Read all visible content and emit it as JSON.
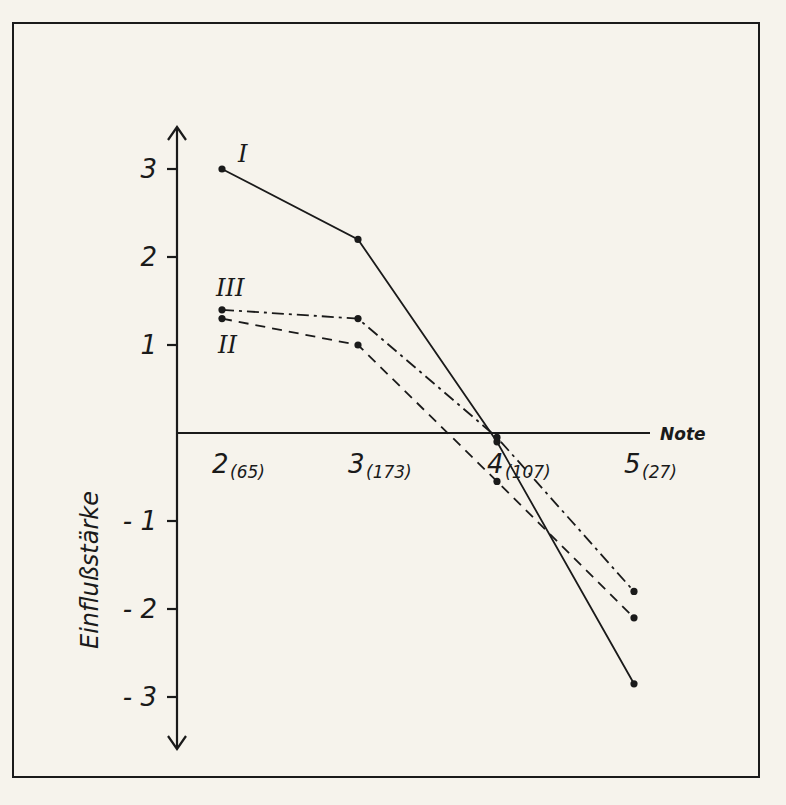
{
  "chart_data": {
    "type": "line",
    "title": "",
    "xlabel": "Note",
    "ylabel": "Einflußstärke",
    "x": [
      2,
      3,
      4,
      5
    ],
    "x_tick_labels": [
      "2",
      "3",
      "4",
      "5"
    ],
    "x_counts": [
      "(65)",
      "(173)",
      "(107)",
      "(27)"
    ],
    "y_ticks": [
      3,
      2,
      1,
      -1,
      -2,
      -3
    ],
    "y_tick_labels": [
      "3",
      "2",
      "1",
      "- 1",
      "- 2",
      "- 3"
    ],
    "ylim": [
      -3.5,
      3.5
    ],
    "grid": false,
    "series": [
      {
        "name": "I",
        "style": "solid",
        "values": [
          3.0,
          2.2,
          -0.1,
          -2.85
        ]
      },
      {
        "name": "II",
        "style": "dashed",
        "values": [
          1.3,
          1.0,
          -0.55,
          -2.1
        ]
      },
      {
        "name": "III",
        "style": "dash-dot",
        "values": [
          1.4,
          1.3,
          -0.05,
          -1.8
        ]
      }
    ]
  }
}
